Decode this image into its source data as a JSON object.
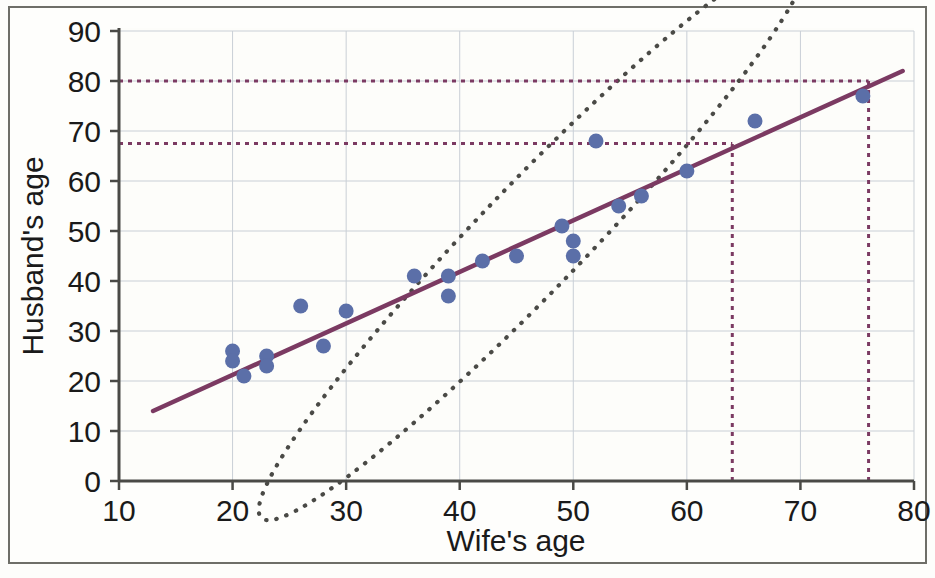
{
  "chart_data": {
    "type": "scatter",
    "title": "",
    "xlabel": "Wife's age",
    "ylabel": "Husband's age",
    "xlim": [
      10,
      80
    ],
    "ylim": [
      0,
      90
    ],
    "xticks": [
      10,
      20,
      30,
      40,
      50,
      60,
      70,
      80
    ],
    "yticks": [
      0,
      10,
      20,
      30,
      40,
      50,
      60,
      70,
      80,
      90
    ],
    "grid": true,
    "legend": "none",
    "point_color": "#5b6fa8",
    "regression_color": "#7b3a62",
    "ellipse_color": "#4a4a46",
    "guide_color": "#7b3a62",
    "x": [
      20,
      20,
      21,
      23,
      23,
      26,
      28,
      30,
      36,
      39,
      39,
      42,
      45,
      49,
      50,
      50,
      50,
      52,
      54,
      56,
      60,
      66,
      75.5
    ],
    "y": [
      26,
      24,
      21,
      25,
      23,
      35,
      27,
      34,
      41,
      41,
      37,
      44,
      45,
      51,
      48,
      45,
      45,
      68,
      55,
      57,
      62,
      72,
      77
    ],
    "points": [
      {
        "x": 20,
        "y": 26
      },
      {
        "x": 20,
        "y": 24
      },
      {
        "x": 21,
        "y": 21
      },
      {
        "x": 23,
        "y": 25
      },
      {
        "x": 23,
        "y": 23
      },
      {
        "x": 26,
        "y": 35
      },
      {
        "x": 28,
        "y": 27
      },
      {
        "x": 30,
        "y": 34
      },
      {
        "x": 36,
        "y": 41
      },
      {
        "x": 39,
        "y": 41
      },
      {
        "x": 39,
        "y": 37
      },
      {
        "x": 42,
        "y": 44
      },
      {
        "x": 45,
        "y": 45
      },
      {
        "x": 49,
        "y": 51
      },
      {
        "x": 50,
        "y": 48
      },
      {
        "x": 50,
        "y": 45
      },
      {
        "x": 52,
        "y": 68
      },
      {
        "x": 54,
        "y": 55
      },
      {
        "x": 56,
        "y": 57
      },
      {
        "x": 60,
        "y": 62
      },
      {
        "x": 66,
        "y": 72
      },
      {
        "x": 75.5,
        "y": 77
      }
    ],
    "regression_line": {
      "x1": 13,
      "y1": 14,
      "x2": 79,
      "y2": 82,
      "label": "least-squares regression line"
    },
    "ellipse": {
      "center_x": 46.5,
      "center_y": 49,
      "semi_major": 34.5,
      "semi_minor": 10.5,
      "angle_deg": -46,
      "style": "dotted"
    },
    "guides": [
      {
        "name": "horizontal-guide-80",
        "type": "horizontal",
        "value": 80,
        "from_x": 10,
        "to_x": 76
      },
      {
        "name": "horizontal-guide-67",
        "type": "horizontal",
        "value": 67.5,
        "from_x": 10,
        "to_x": 64
      },
      {
        "name": "vertical-guide-64",
        "type": "vertical",
        "value": 64,
        "from_y": 0,
        "to_y": 67.5
      },
      {
        "name": "vertical-guide-76",
        "type": "vertical",
        "value": 76,
        "from_y": 0,
        "to_y": 80
      }
    ]
  },
  "axes": {
    "x_label": "Wife's age",
    "y_label": "Husband's age",
    "x_ticks": [
      "10",
      "20",
      "30",
      "40",
      "50",
      "60",
      "70",
      "80"
    ],
    "y_ticks": [
      "0",
      "10",
      "20",
      "30",
      "40",
      "50",
      "60",
      "70",
      "80",
      "90"
    ]
  }
}
